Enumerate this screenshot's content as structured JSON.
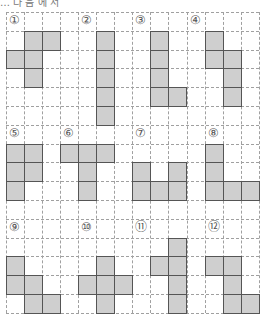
{
  "header": {
    "text": "… 다 음 에 서"
  },
  "grid": {
    "cols": 14,
    "rows": 16,
    "cell_w": 18.1,
    "cell_h": 18.8,
    "line_color": "#a0a0a0",
    "fill_color": "#cfcfcf",
    "border_color": "#555555"
  },
  "puzzles": [
    {
      "label": "①",
      "label_cell": [
        0,
        0
      ],
      "cells": [
        [
          1,
          1
        ],
        [
          2,
          1
        ],
        [
          0,
          2
        ],
        [
          1,
          2
        ],
        [
          1,
          3
        ]
      ]
    },
    {
      "label": "②",
      "label_cell": [
        4,
        0
      ],
      "cells": [
        [
          5,
          1
        ],
        [
          5,
          2
        ],
        [
          5,
          3
        ],
        [
          5,
          4
        ],
        [
          5,
          5
        ]
      ]
    },
    {
      "label": "③",
      "label_cell": [
        7,
        0
      ],
      "cells": [
        [
          8,
          1
        ],
        [
          8,
          2
        ],
        [
          8,
          3
        ],
        [
          8,
          4
        ],
        [
          9,
          4
        ]
      ]
    },
    {
      "label": "④",
      "label_cell": [
        10,
        0
      ],
      "cells": [
        [
          11,
          1
        ],
        [
          11,
          2
        ],
        [
          12,
          2
        ],
        [
          12,
          3
        ],
        [
          12,
          4
        ]
      ]
    },
    {
      "label": "⑤",
      "label_cell": [
        0,
        6
      ],
      "cells": [
        [
          0,
          7
        ],
        [
          1,
          7
        ],
        [
          0,
          8
        ],
        [
          1,
          8
        ],
        [
          0,
          9
        ]
      ]
    },
    {
      "label": "⑥",
      "label_cell": [
        3,
        6
      ],
      "cells": [
        [
          3,
          7
        ],
        [
          4,
          7
        ],
        [
          5,
          7
        ],
        [
          4,
          8
        ],
        [
          4,
          9
        ]
      ]
    },
    {
      "label": "⑦",
      "label_cell": [
        7,
        6
      ],
      "cells": [
        [
          7,
          8
        ],
        [
          9,
          8
        ],
        [
          7,
          9
        ],
        [
          8,
          9
        ],
        [
          9,
          9
        ]
      ]
    },
    {
      "label": "⑧",
      "label_cell": [
        11,
        6
      ],
      "cells": [
        [
          11,
          7
        ],
        [
          11,
          8
        ],
        [
          11,
          9
        ],
        [
          12,
          9
        ],
        [
          13,
          9
        ]
      ]
    },
    {
      "label": "⑨",
      "label_cell": [
        0,
        11
      ],
      "cells": [
        [
          0,
          13
        ],
        [
          0,
          14
        ],
        [
          1,
          14
        ],
        [
          1,
          15
        ],
        [
          2,
          15
        ]
      ]
    },
    {
      "label": "⑩",
      "label_cell": [
        4,
        11
      ],
      "cells": [
        [
          5,
          13
        ],
        [
          4,
          14
        ],
        [
          5,
          14
        ],
        [
          6,
          14
        ],
        [
          5,
          15
        ]
      ]
    },
    {
      "label": "⑪",
      "label_cell": [
        7,
        11
      ],
      "cells": [
        [
          9,
          12
        ],
        [
          8,
          13
        ],
        [
          9,
          13
        ],
        [
          9,
          14
        ],
        [
          9,
          15
        ]
      ]
    },
    {
      "label": "⑫",
      "label_cell": [
        11,
        11
      ],
      "cells": [
        [
          11,
          13
        ],
        [
          12,
          13
        ],
        [
          12,
          14
        ],
        [
          12,
          15
        ],
        [
          13,
          15
        ]
      ]
    }
  ]
}
